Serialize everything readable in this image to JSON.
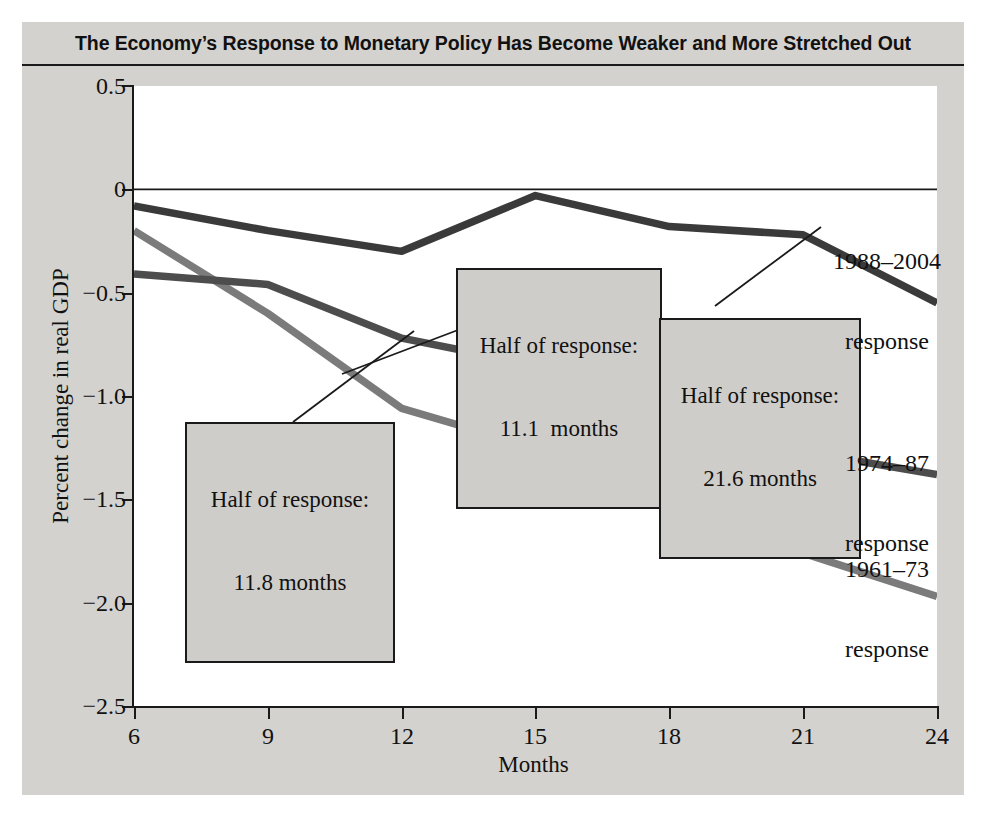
{
  "title": "The Economy’s Response to Monetary Policy Has Become Weaker and More Stretched Out",
  "axis": {
    "ylabel": "Percent change in real GDP",
    "xlabel": "Months",
    "yticks": [
      "0.5",
      "0",
      "−0.5",
      "−1.0",
      "−1.5",
      "−2.0",
      "−2.5"
    ],
    "xticks": [
      "6",
      "9",
      "12",
      "15",
      "18",
      "21",
      "24"
    ]
  },
  "colors": {
    "figure_background": "#d4d2cf",
    "plot_background": "#ffffff",
    "axis": "#1a1a1a",
    "series_1988_2004": "#3a3a3a",
    "series_1974_87": "#4d4d4d",
    "series_1961_73": "#7b7b7b",
    "callout_fill": "#cfcdca"
  },
  "callouts": [
    {
      "line1": "Half of response:",
      "line2": "11.1  months"
    },
    {
      "line1": "Half of response:",
      "line2": "21.6 months"
    },
    {
      "line1": "Half of response:",
      "line2": "11.8 months"
    }
  ],
  "series_labels": [
    {
      "line1": "1988–2004",
      "line2": "response"
    },
    {
      "line1": "1974–87",
      "line2": "response"
    },
    {
      "line1": "1961–73",
      "line2": "response"
    }
  ],
  "chart_data": {
    "type": "line",
    "title": "The Economy’s Response to Monetary Policy Has Become Weaker and More Stretched Out",
    "xlabel": "Months",
    "ylabel": "Percent change in real GDP",
    "x": [
      6,
      9,
      12,
      15,
      18,
      21,
      24
    ],
    "xlim": [
      6,
      24
    ],
    "ylim": [
      -2.5,
      0.5
    ],
    "yticks": [
      0.5,
      0,
      -0.5,
      -1.0,
      -1.5,
      -2.0,
      -2.5
    ],
    "grid": false,
    "legend": "inline-labels-right",
    "series": [
      {
        "name": "1988–2004 response",
        "color": "#3a3a3a",
        "values": [
          -0.08,
          -0.2,
          -0.3,
          -0.03,
          -0.18,
          -0.22,
          -0.55
        ],
        "half_of_response_months": 21.6
      },
      {
        "name": "1974–87 response",
        "color": "#4d4d4d",
        "values": [
          -0.41,
          -0.46,
          -0.72,
          -0.85,
          -1.05,
          -1.27,
          -1.38
        ],
        "half_of_response_months": 11.1
      },
      {
        "name": "1961–73 response",
        "color": "#7b7b7b",
        "values": [
          -0.2,
          -0.6,
          -1.06,
          -1.25,
          -1.43,
          -1.76,
          -1.97
        ],
        "half_of_response_months": 11.8
      }
    ],
    "annotations": [
      {
        "text": "Half of response: 11.1  months",
        "series": "1974–87 response"
      },
      {
        "text": "Half of response: 21.6 months",
        "series": "1988–2004 response"
      },
      {
        "text": "Half of response: 11.8 months",
        "series": "1961–73 response"
      }
    ]
  }
}
